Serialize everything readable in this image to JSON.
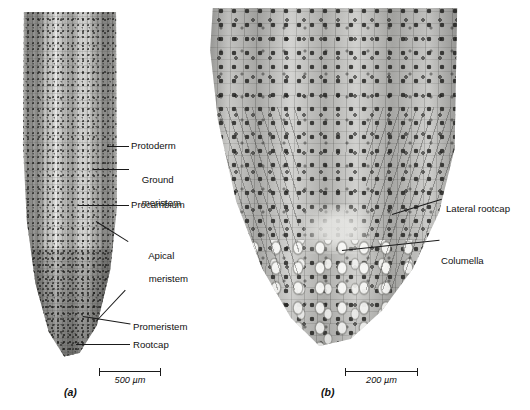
{
  "figure": {
    "type": "light-micrograph-plate",
    "background_color": "#ffffff",
    "annotation_color": "#111111"
  },
  "panels": [
    {
      "id": "a",
      "panel_label": "(a)",
      "magnification_note": "low magnification whole root tip",
      "scalebar": {
        "length_label": "500 µm",
        "bar_pixel_length": 62
      },
      "tissue_tone": "#c9c9c6",
      "labels": [
        {
          "key": "protoderm",
          "text": "Protoderm",
          "lines": [
            "Protoderm"
          ]
        },
        {
          "key": "ground-meristem",
          "text": "Ground meristem",
          "lines": [
            "Ground",
            "meristem"
          ]
        },
        {
          "key": "procambium",
          "text": "Procambium",
          "lines": [
            "Procambium"
          ]
        },
        {
          "key": "apical-meristem",
          "text": "Apical meristem",
          "lines": [
            "Apical",
            "meristem"
          ]
        },
        {
          "key": "promeristem",
          "text": "Promeristem",
          "lines": [
            "Promeristem"
          ]
        },
        {
          "key": "rootcap",
          "text": "Rootcap",
          "lines": [
            "Rootcap"
          ]
        }
      ]
    },
    {
      "id": "b",
      "panel_label": "(b)",
      "magnification_note": "high magnification root apex",
      "scalebar": {
        "length_label": "200 µm",
        "bar_pixel_length": 73
      },
      "tissue_tone": "#c4c4c1",
      "labels": [
        {
          "key": "lateral-rootcap",
          "text": "Lateral rootcap",
          "lines": [
            "Lateral rootcap"
          ]
        },
        {
          "key": "columella",
          "text": "Columella",
          "lines": [
            "Columella"
          ]
        }
      ]
    }
  ]
}
